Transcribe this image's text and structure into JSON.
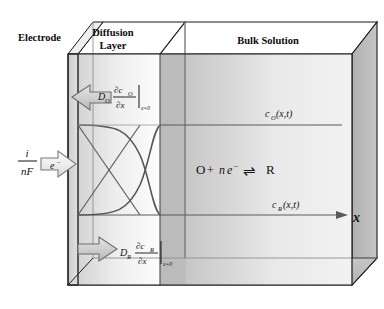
{
  "figure": {
    "type": "diagram",
    "regions": {
      "electrode_label": "Electrode",
      "diffusion_layer_label_line1": "Diffusion",
      "diffusion_layer_label_line2": "Layer",
      "bulk_solution_label": "Bulk Solution"
    },
    "current_term": {
      "numerator": "i",
      "denominator": "nF"
    },
    "electron_arrow_label": {
      "symbol": "e",
      "superscript": "–"
    },
    "flux_top": {
      "diffusion_coefficient": "D",
      "diffusion_subscript": "O",
      "numerator_partial": "∂c",
      "numerator_subscript": "O",
      "denominator": "∂x",
      "evaluated_at": "x=0"
    },
    "flux_bottom": {
      "diffusion_coefficient": "D",
      "diffusion_subscript": "R",
      "numerator_partial": "∂c",
      "numerator_subscript": "R",
      "denominator": "∂x",
      "evaluated_at": "x=0"
    },
    "reaction": {
      "oxidized": "O",
      "plus": "+",
      "electrons_n": "n",
      "electrons_e": "e",
      "electrons_charge": "–",
      "equilibrium_arrow": "⇌",
      "reduced": "R"
    },
    "curve_label_oxidized": "c",
    "curve_label_oxidized_sub": "O",
    "curve_label_oxidized_args": "(x,t)",
    "curve_label_reduced": "c",
    "curve_label_reduced_sub": "R",
    "curve_label_reduced_args": "(x,t)",
    "axis_label_x": "x"
  },
  "colors": {
    "outline": "#1a1a1a",
    "face_front_bulk": "#c3c3c3",
    "face_top": "#ffffff",
    "face_top_shade": "#c9c9c9",
    "face_right": "#b3b3b3",
    "face_bottom": "#bdbdbd",
    "diffusion_panel": "#e4e4e4",
    "electrode_fill": "#d2d2d2",
    "arrow_fill": "#d0d0d0",
    "arrow_fill_light": "#e8e8e8",
    "curve_stroke": "#555555",
    "interior_line": "#8a8a8a"
  }
}
